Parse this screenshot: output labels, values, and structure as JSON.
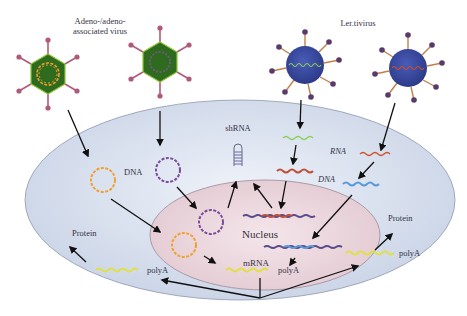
{
  "diagram": {
    "title_labels": {
      "adeno_line1": "Adeno-/adeno-",
      "adeno_line2": "associated virus",
      "lentivirus": "Ler.tivirus"
    },
    "labels": {
      "dna_left": "DNA",
      "shrna": "shRNA",
      "rna": "RNA",
      "dna_right": "DNA",
      "nucleus": "Nucleus",
      "mrna": "mRNA",
      "polya_center": "polyA",
      "polya_left": "polyA",
      "polya_right": "polyA",
      "protein_left": "Protein",
      "protein_right": "Protein"
    },
    "colors": {
      "adeno_capsid": "#2f6b1e",
      "adeno_capsid_edge": "#8fc33a",
      "adeno_spike": "#b05a7a",
      "adeno_dna_orange": "#f0a030",
      "adeno_dna_purple": "#7a4a9a",
      "lenti_body": "#3a4aa0",
      "lenti_spike": "#c0804a",
      "lenti_knob": "#5a3a6a",
      "rna_green": "#8ccf5a",
      "rna_red": "#d0502a",
      "dna_blue": "#5a9ad8",
      "polya_yellow": "#e8e840",
      "cell_fill": "#dfe6f2",
      "nucleus_fill": "#ecd8de"
    }
  }
}
